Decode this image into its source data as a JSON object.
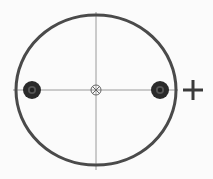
{
  "diagram": {
    "colors": {
      "background": "#fbfbfb",
      "outline": "#4a4a4a",
      "axis": "#9a9a9a",
      "dot_outer": "#2a2a2a",
      "dot_inner": "#555555",
      "plus": "#3a3a3a",
      "center_marker": "#666666"
    },
    "circle": {
      "cx": 96,
      "cy": 90,
      "rx": 80,
      "ry": 75
    },
    "axes": {
      "vertical": {
        "x": 96,
        "y1": 12,
        "y2": 170
      },
      "horizontal": {
        "y": 90,
        "x1": 13,
        "x2": 178
      }
    },
    "dots": [
      {
        "name": "left-hole",
        "cx": 32,
        "cy": 90,
        "r": 9
      },
      {
        "name": "right-hole",
        "cx": 160,
        "cy": 90,
        "r": 9
      }
    ],
    "center_marker": {
      "cx": 96,
      "cy": 90,
      "r": 5,
      "symbol": "circle-x"
    },
    "plus": {
      "cx": 193,
      "cy": 90,
      "half": 10,
      "symbol": "+"
    }
  }
}
